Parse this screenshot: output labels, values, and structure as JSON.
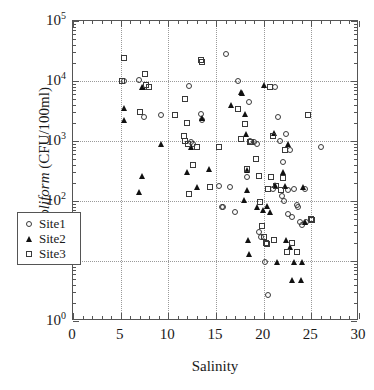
{
  "chart_data": {
    "type": "scatter",
    "title": "",
    "xlabel": "Salinity",
    "ylabel": "E. coliform (CFU/100ml)",
    "ylabel_italic_part": "E. coliform",
    "ylabel_plain_part": " (CFU/100ml)",
    "xlim": [
      0,
      30
    ],
    "ylim": [
      1,
      100000
    ],
    "yscale": "log",
    "xscale": "linear",
    "grid": true,
    "grid_style": "dotted",
    "legend_position": "lower-left-inside",
    "xticks": [
      0,
      5,
      10,
      15,
      20,
      25,
      30
    ],
    "xtick_labels": [
      "0",
      "5",
      "10",
      "15",
      "20",
      "25",
      "30"
    ],
    "x_minor_tick_step": 1,
    "yticks": [
      1,
      10,
      100,
      1000,
      10000,
      100000
    ],
    "ytick_labels": [
      "10⁰",
      "10¹",
      "10²",
      "10³",
      "10⁴",
      "10⁵"
    ],
    "ytick_mantissa": "10",
    "ytick_exponents": [
      "0",
      "1",
      "2",
      "3",
      "4",
      "5"
    ],
    "marker_color": "#333333",
    "series": [
      {
        "name": "Site1",
        "marker": "open-circle",
        "points": [
          [
            5.4,
            10000
          ],
          [
            6.9,
            10500
          ],
          [
            7.4,
            2500
          ],
          [
            9.2,
            2700
          ],
          [
            12.2,
            8200
          ],
          [
            12.4,
            950
          ],
          [
            12.6,
            900
          ],
          [
            13.4,
            2800
          ],
          [
            13.5,
            2200
          ],
          [
            15.3,
            180
          ],
          [
            15.6,
            80
          ],
          [
            15.7,
            78
          ],
          [
            16.0,
            28000
          ],
          [
            16.5,
            170
          ],
          [
            17.0,
            65
          ],
          [
            17.3,
            10000
          ],
          [
            18.2,
            250
          ],
          [
            18.5,
            4500
          ],
          [
            18.6,
            1000
          ],
          [
            19.0,
            950
          ],
          [
            19.3,
            900
          ],
          [
            19.5,
            30
          ],
          [
            19.7,
            25
          ],
          [
            20.1,
            9.8
          ],
          [
            20.5,
            2.7
          ],
          [
            21.0,
            160
          ],
          [
            21.2,
            8000
          ],
          [
            21.5,
            2500
          ],
          [
            21.7,
            1000
          ],
          [
            21.9,
            120
          ],
          [
            22.0,
            450
          ],
          [
            22.1,
            100
          ],
          [
            22.3,
            1300
          ],
          [
            22.5,
            150
          ],
          [
            22.6,
            60
          ],
          [
            22.8,
            700
          ],
          [
            23.0,
            55
          ],
          [
            23.2,
            160
          ],
          [
            23.5,
            85
          ],
          [
            23.6,
            80
          ],
          [
            23.8,
            45
          ],
          [
            24.0,
            40
          ],
          [
            24.3,
            160
          ],
          [
            24.4,
            45
          ],
          [
            26.0,
            780
          ]
        ]
      },
      {
        "name": "Site2",
        "marker": "filled-triangle",
        "points": [
          [
            5.3,
            3500
          ],
          [
            5.4,
            2200
          ],
          [
            7.2,
            8000
          ],
          [
            7.3,
            7800
          ],
          [
            6.9,
            140
          ],
          [
            7.2,
            260
          ],
          [
            9.2,
            900
          ],
          [
            12.0,
            310
          ],
          [
            12.4,
            780
          ],
          [
            13.0,
            170
          ],
          [
            13.5,
            2400
          ],
          [
            14.3,
            340
          ],
          [
            16.6,
            4000
          ],
          [
            17.6,
            6500
          ],
          [
            17.7,
            6300
          ],
          [
            17.9,
            105
          ],
          [
            18.0,
            2800
          ],
          [
            18.1,
            1300
          ],
          [
            18.2,
            330
          ],
          [
            18.3,
            155
          ],
          [
            18.4,
            22
          ],
          [
            18.5,
            13
          ],
          [
            19.3,
            80
          ],
          [
            19.9,
            70
          ],
          [
            20.0,
            8500
          ],
          [
            20.4,
            82
          ],
          [
            20.7,
            65
          ],
          [
            21.1,
            1350
          ],
          [
            21.2,
            185
          ],
          [
            21.4,
            9.8
          ],
          [
            22.0,
            300
          ],
          [
            22.2,
            180
          ],
          [
            22.3,
            22
          ],
          [
            22.5,
            900
          ],
          [
            22.8,
            17
          ],
          [
            23.0,
            4.8
          ],
          [
            23.2,
            9.8
          ],
          [
            23.9,
            4.8
          ],
          [
            24.0,
            9.8
          ],
          [
            24.1,
            170
          ],
          [
            24.3,
            45
          ]
        ]
      },
      {
        "name": "Site3",
        "marker": "open-square",
        "points": [
          [
            5.1,
            10000
          ],
          [
            5.4,
            24000
          ],
          [
            7.0,
            3000
          ],
          [
            7.6,
            13000
          ],
          [
            7.7,
            8500
          ],
          [
            8.0,
            8000
          ],
          [
            10.7,
            2700
          ],
          [
            11.6,
            1200
          ],
          [
            11.7,
            5000
          ],
          [
            11.8,
            1000
          ],
          [
            12.0,
            2000
          ],
          [
            12.1,
            900
          ],
          [
            12.2,
            130
          ],
          [
            12.6,
            400
          ],
          [
            13.0,
            800
          ],
          [
            13.4,
            22000
          ],
          [
            13.5,
            21000
          ],
          [
            14.4,
            170
          ],
          [
            15.3,
            800
          ],
          [
            17.3,
            3400
          ],
          [
            17.6,
            1100
          ],
          [
            18.0,
            1900
          ],
          [
            18.3,
            340
          ],
          [
            18.6,
            960
          ],
          [
            18.7,
            950
          ],
          [
            19.2,
            500
          ],
          [
            19.5,
            260
          ],
          [
            19.6,
            95
          ],
          [
            19.8,
            38
          ],
          [
            20.0,
            25
          ],
          [
            20.2,
            20
          ],
          [
            20.3,
            19
          ],
          [
            20.5,
            160
          ],
          [
            20.7,
            8000
          ],
          [
            20.8,
            250
          ],
          [
            21.0,
            1200
          ],
          [
            21.1,
            22
          ],
          [
            21.3,
            180
          ],
          [
            21.8,
            150
          ],
          [
            22.0,
            240
          ],
          [
            22.2,
            700
          ],
          [
            22.4,
            14
          ],
          [
            23.0,
            20
          ],
          [
            23.5,
            14
          ],
          [
            24.7,
            2700
          ],
          [
            25.0,
            50
          ],
          [
            25.1,
            48
          ]
        ]
      }
    ],
    "legend_entries": [
      {
        "label": "Site1",
        "marker": "open-circle"
      },
      {
        "label": "Site2",
        "marker": "filled-triangle"
      },
      {
        "label": "Site3",
        "marker": "open-square"
      }
    ]
  }
}
